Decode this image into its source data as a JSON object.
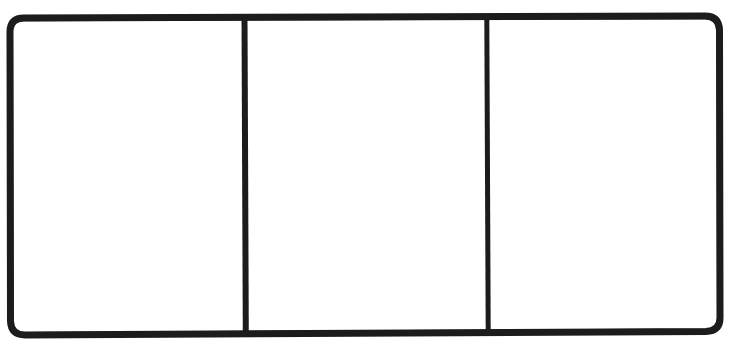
{
  "diagram": {
    "kind": "three-panel-frame",
    "title": "",
    "stroke_color": "#1c1c1c",
    "fill_color": "#ffffff",
    "background_color": "#ffffff",
    "stroke_width_px": 7,
    "corner_radius_px": 14,
    "frame": {
      "left_px": 10,
      "top_px": 18,
      "right_px": 719,
      "bottom_px": 331,
      "width_px": 709,
      "height_px": 313
    },
    "dividers": [
      {
        "name": "divider-1",
        "x_px": 244,
        "stroke_width_px": 6
      },
      {
        "name": "divider-2",
        "x_px": 487,
        "stroke_width_px": 5
      }
    ],
    "panels": [
      {
        "id": "panel-left",
        "label": "",
        "index": 1,
        "x_px": 14,
        "y_px": 22,
        "width_px": 227,
        "height_px": 305,
        "empty": true
      },
      {
        "id": "panel-middle",
        "label": "",
        "index": 2,
        "x_px": 248,
        "y_px": 22,
        "width_px": 236,
        "height_px": 305,
        "empty": true
      },
      {
        "id": "panel-right",
        "label": "",
        "index": 3,
        "x_px": 491,
        "y_px": 22,
        "width_px": 225,
        "height_px": 305,
        "empty": true
      }
    ]
  }
}
